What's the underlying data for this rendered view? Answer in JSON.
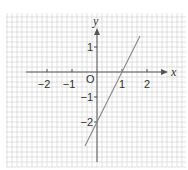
{
  "chart_data": {
    "type": "line",
    "title": "",
    "xlabel": "x",
    "ylabel": "y",
    "origin_label": "O",
    "xlim": [
      -3.6,
      3.6
    ],
    "ylim": [
      -3.8,
      2.4
    ],
    "x_ticks": [
      -2,
      -1,
      1,
      2
    ],
    "x_tick_labels": [
      "−2",
      "−1",
      "1",
      "2"
    ],
    "y_ticks": [
      1,
      -1,
      -2
    ],
    "y_tick_labels": [
      "1",
      "−1",
      "−2"
    ],
    "grid": true,
    "grid_minor_per_unit": 5,
    "series": [
      {
        "name": "y = 2x - 2",
        "equation": "y = 2x - 2",
        "x": [
          -0.48,
          1.72
        ],
        "y": [
          -2.96,
          1.44
        ],
        "color": "#888888"
      }
    ],
    "key_points": [
      {
        "x": 0,
        "y": -2,
        "note": "y-intercept"
      },
      {
        "x": 1,
        "y": 0,
        "note": "x-intercept"
      }
    ],
    "colors": {
      "grid": "#cfcfcf",
      "axis": "#555555",
      "line": "#8a8a8a",
      "text": "#333333"
    }
  }
}
